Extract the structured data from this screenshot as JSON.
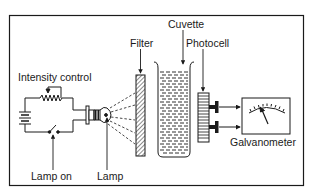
{
  "diagram": {
    "type": "photometer schematic",
    "colors": {
      "line": "#1a1a1a",
      "background": "#ffffff"
    },
    "labels": {
      "intensity_control": "Intensity control",
      "filter": "Filter",
      "cuvette": "Cuvette",
      "photocell": "Photocell",
      "lamp_on": "Lamp on",
      "lamp": "Lamp",
      "galvanometer": "Galvanometer"
    },
    "components": [
      {
        "id": "battery",
        "icon": "battery-icon"
      },
      {
        "id": "rheostat",
        "icon": "variable-resistor-icon"
      },
      {
        "id": "switch",
        "icon": "switch-icon"
      },
      {
        "id": "lamp",
        "icon": "light-bulb-icon"
      },
      {
        "id": "filter",
        "icon": "hatched-filter-icon"
      },
      {
        "id": "cuvette",
        "icon": "cuvette-icon"
      },
      {
        "id": "photocell",
        "icon": "photocell-icon"
      },
      {
        "id": "galvanometer",
        "icon": "meter-dial-icon"
      }
    ]
  }
}
